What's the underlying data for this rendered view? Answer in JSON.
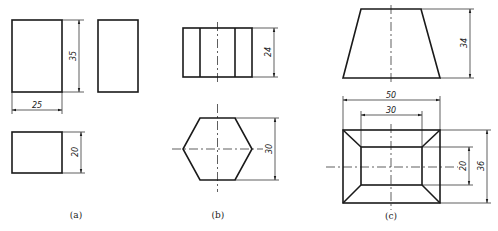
{
  "figure": {
    "captions": {
      "a": "(a)",
      "b": "(b)",
      "c": "(c)"
    },
    "views": {
      "a": {
        "description": "Rectangular prism: front, side and top views",
        "dimensions": {
          "width": "25",
          "height": "35",
          "depth": "20"
        }
      },
      "b": {
        "description": "Hexagonal prism: front and top views",
        "dimensions": {
          "height": "24",
          "across_flats": "30"
        }
      },
      "c": {
        "description": "Frustum of square pyramid: front and top views",
        "dimensions": {
          "height": "34",
          "bottom_width": "50",
          "top_width": "30",
          "bottom_depth": "36",
          "top_depth": "20"
        }
      }
    }
  }
}
